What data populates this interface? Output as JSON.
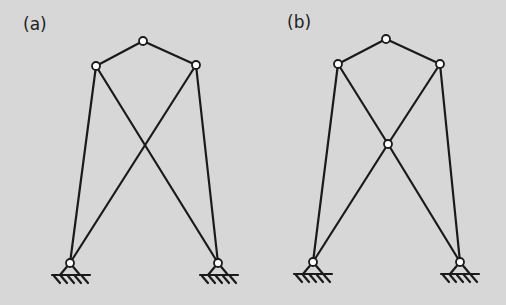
{
  "figure": {
    "panels": [
      {
        "label": "(a)",
        "label_pos": [
          24,
          20
        ]
      },
      {
        "label": "(b)",
        "label_pos": [
          287,
          17
        ]
      }
    ],
    "colors": {
      "background": "#d7d7d7",
      "line": "#1a1a1a",
      "node_fill": "#ffffff"
    }
  }
}
